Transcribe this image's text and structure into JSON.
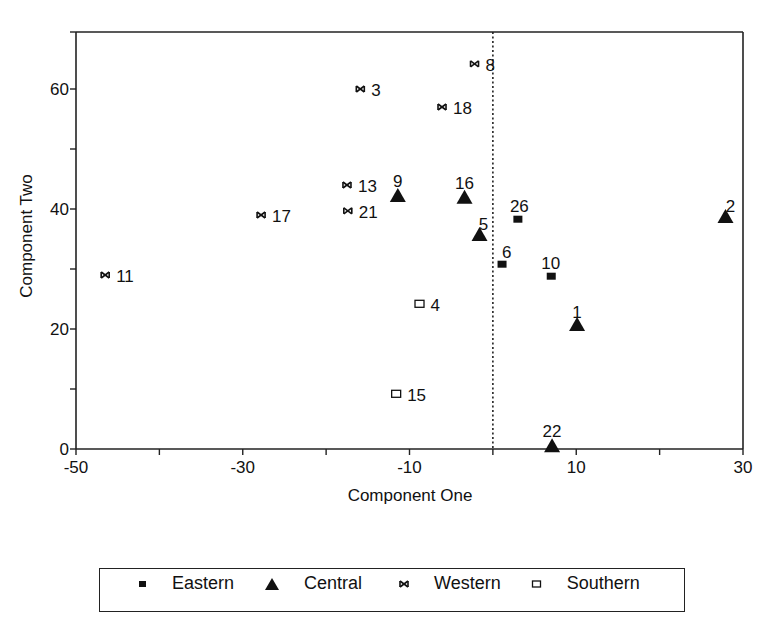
{
  "chart_data": {
    "type": "scatter",
    "title": "",
    "xlabel": "Component One",
    "ylabel": "Component Two",
    "xlim": [
      -50,
      30
    ],
    "ylim": [
      0,
      70
    ],
    "x_ticks": [
      -50,
      -40,
      -30,
      -20,
      -10,
      0,
      10,
      20,
      30
    ],
    "x_tick_labels": [
      "-50",
      "",
      "-30",
      "",
      "-10",
      "",
      "10",
      "",
      "30"
    ],
    "y_ticks": [
      0,
      10,
      20,
      30,
      40,
      50,
      60
    ],
    "y_tick_labels": [
      "0",
      "",
      "20",
      "",
      "40",
      "",
      "60"
    ],
    "grid": false,
    "reference_line": {
      "orientation": "vertical",
      "x": 0,
      "style": "dotted"
    },
    "legend_position": "bottom",
    "series": [
      {
        "name": "Eastern",
        "marker": "filled-square",
        "points": [
          {
            "label": "26",
            "x": 3.0,
            "y": 38.3
          },
          {
            "label": "6",
            "x": 1.1,
            "y": 30.8
          },
          {
            "label": "10",
            "x": 7.0,
            "y": 28.8
          }
        ]
      },
      {
        "name": "Central",
        "marker": "filled-triangle",
        "points": [
          {
            "label": "9",
            "x": -11.4,
            "y": 42.0
          },
          {
            "label": "16",
            "x": -3.4,
            "y": 41.7
          },
          {
            "label": "5",
            "x": -1.6,
            "y": 35.5
          },
          {
            "label": "1",
            "x": 10.1,
            "y": 20.5
          },
          {
            "label": "2",
            "x": 27.9,
            "y": 38.5
          },
          {
            "label": "22",
            "x": 7.1,
            "y": 0.3
          }
        ]
      },
      {
        "name": "Western",
        "marker": "asterisk",
        "points": [
          {
            "label": "8",
            "x": -2.2,
            "y": 64.2
          },
          {
            "label": "3",
            "x": -15.9,
            "y": 60.0
          },
          {
            "label": "18",
            "x": -6.1,
            "y": 57.0
          },
          {
            "label": "13",
            "x": -17.5,
            "y": 44.0
          },
          {
            "label": "21",
            "x": -17.4,
            "y": 39.7
          },
          {
            "label": "17",
            "x": -27.8,
            "y": 39.0
          },
          {
            "label": "11",
            "x": -46.5,
            "y": 29.0
          }
        ]
      },
      {
        "name": "Southern",
        "marker": "open-square",
        "points": [
          {
            "label": "4",
            "x": -8.8,
            "y": 24.2
          },
          {
            "label": "15",
            "x": -11.6,
            "y": 9.2
          }
        ]
      }
    ]
  },
  "legend": {
    "items": [
      {
        "label": "Eastern",
        "marker": "filled-square"
      },
      {
        "label": "Central",
        "marker": "filled-triangle"
      },
      {
        "label": "Western",
        "marker": "asterisk"
      },
      {
        "label": "Southern",
        "marker": "open-square"
      }
    ]
  }
}
